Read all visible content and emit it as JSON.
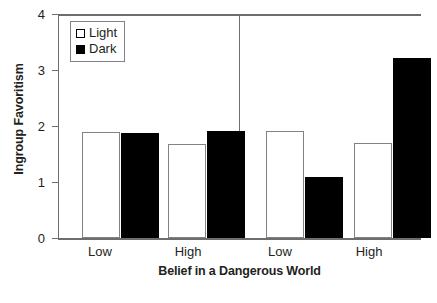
{
  "chart_data": {
    "type": "bar",
    "title": "",
    "xlabel": "Belief in a Dangerous World",
    "ylabel": "Ingroup Favoritism",
    "ylim": [
      0,
      4
    ],
    "yticks": [
      "0",
      "1",
      "2",
      "3",
      "4"
    ],
    "grid": false,
    "legend_position": "top-left",
    "categories": [
      "Low",
      "High",
      "Low",
      "High"
    ],
    "panel_divider_after_category_index": 1,
    "series": [
      {
        "name": "Light",
        "color": "#ffffff",
        "values": [
          1.89,
          1.68,
          1.91,
          1.7
        ]
      },
      {
        "name": "Dark",
        "color": "#000000",
        "values": [
          1.88,
          1.91,
          1.09,
          3.22
        ]
      }
    ]
  },
  "legend": {
    "items": [
      {
        "label": "Light",
        "swatch": "light-square-icon"
      },
      {
        "label": "Dark",
        "swatch": "dark-square-icon"
      }
    ]
  },
  "axes": {
    "y": {
      "title": "Ingroup Favoritism",
      "ticks": [
        "4",
        "3",
        "2",
        "1",
        "0"
      ]
    },
    "x": {
      "title": "Belief in a Dangerous World",
      "ticks": [
        "Low",
        "High",
        "Low",
        "High"
      ]
    }
  }
}
